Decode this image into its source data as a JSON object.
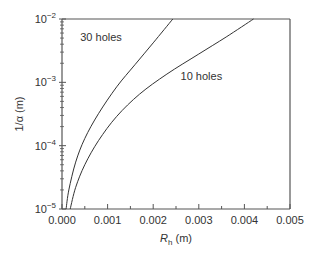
{
  "chart_data": {
    "type": "line",
    "title": "",
    "xlabel": "R_h (m)",
    "xlabel_main": "R",
    "xlabel_sub": "h",
    "xlabel_unit": " (m)",
    "ylabel": "1/α (m)",
    "xlim": [
      0,
      0.005
    ],
    "ylim": [
      1e-05,
      0.01
    ],
    "yscale": "log",
    "grid": false,
    "x_ticks": [
      "0.000",
      "0.001",
      "0.002",
      "0.003",
      "0.004",
      "0.005"
    ],
    "y_ticks": [
      {
        "base": "10",
        "exp": "−5"
      },
      {
        "base": "10",
        "exp": "−4"
      },
      {
        "base": "10",
        "exp": "−3"
      },
      {
        "base": "10",
        "exp": "−2"
      }
    ],
    "series": [
      {
        "name": "30 holes",
        "x": [
          9e-05,
          0.00015,
          0.0003,
          0.0005,
          0.0008,
          0.0012,
          0.0016,
          0.002,
          0.00243
        ],
        "y": [
          1e-05,
          2e-05,
          5.5e-05,
          0.00013,
          0.00032,
          0.00085,
          0.0019,
          0.0042,
          0.01
        ]
      },
      {
        "name": "10 holes",
        "x": [
          0.00018,
          0.0003,
          0.0005,
          0.0008,
          0.0012,
          0.0017,
          0.0023,
          0.003,
          0.0036,
          0.0042
        ],
        "y": [
          1e-05,
          2.2e-05,
          5e-05,
          0.00012,
          0.00029,
          0.00065,
          0.00135,
          0.0028,
          0.0052,
          0.01
        ]
      }
    ],
    "annotations": [
      {
        "text": "30 holes",
        "x": 0.0004,
        "y": 0.0045
      },
      {
        "text": "10 holes",
        "x": 0.0026,
        "y": 0.0011
      }
    ],
    "legend": "none (inline labels)"
  }
}
